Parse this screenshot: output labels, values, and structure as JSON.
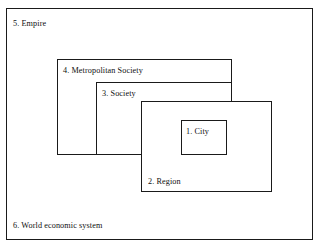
{
  "figure": {
    "type": "nested-rectangles-diagram",
    "background_color": "#ffffff",
    "line_color": "#1a1a1a",
    "text_color": "#101010"
  },
  "levels": [
    {
      "number": "1",
      "label": "1. City",
      "name": "City",
      "label_position": "inside-left",
      "rect": {
        "x": 181,
        "y": 120,
        "width": 46,
        "height": 35
      }
    },
    {
      "number": "2",
      "label": "2. Region",
      "name": "Region",
      "label_position": "bottom-left",
      "rect": {
        "x": 141,
        "y": 101,
        "width": 131,
        "height": 91
      }
    },
    {
      "number": "3",
      "label": "3. Society",
      "name": "Society",
      "label_position": "top-left",
      "rect": {
        "x": 96,
        "y": 82,
        "width": 136,
        "height": 73
      }
    },
    {
      "number": "4",
      "label": "4. Metropolitan Society",
      "name": "Metropolitan Society",
      "label_position": "top-left",
      "rect": {
        "x": 57,
        "y": 59,
        "width": 175,
        "height": 96
      }
    },
    {
      "number": "5",
      "label": "5. Empire",
      "name": "Empire",
      "label_position": "top-left-of-outer-frame",
      "rect": {
        "x": 6,
        "y": 8,
        "width": 307,
        "height": 232
      }
    },
    {
      "number": "6",
      "label": "6. World economic system",
      "name": "World economic system",
      "label_position": "bottom-left-of-outer-frame",
      "rect": {
        "x": 6,
        "y": 8,
        "width": 307,
        "height": 232
      }
    }
  ]
}
